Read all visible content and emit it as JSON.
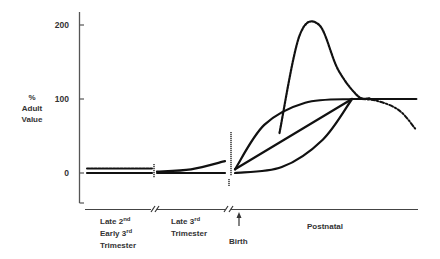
{
  "chart_data": {
    "type": "line",
    "title": "",
    "ylabel": [
      "%",
      "Adult",
      "Value"
    ],
    "xlabel": "",
    "ylim": [
      -40,
      220
    ],
    "yticks": [
      0,
      100,
      200
    ],
    "ytick_labels": [
      "0",
      "100",
      "200"
    ],
    "grid": false,
    "periods": [
      {
        "name": "late-2nd-early-3rd",
        "label_lines": [
          [
            "Late 2",
            "nd"
          ],
          [
            "Early 3",
            "rd"
          ],
          [
            "Trimester",
            ""
          ]
        ]
      },
      {
        "name": "late-3rd",
        "label_lines": [
          [
            "Late 3",
            "rd"
          ],
          [
            "Trimester",
            ""
          ]
        ]
      },
      {
        "name": "birth",
        "label_lines": [
          [
            "Birth",
            ""
          ]
        ],
        "marker": "up-arrow"
      },
      {
        "name": "postnatal",
        "label_lines": [
          [
            "Postnatal",
            ""
          ]
        ]
      }
    ],
    "axis_breaks": [
      "between-period-1-and-2",
      "between-period-2-and-postnatal"
    ],
    "series": [
      {
        "name": "prenatal-dashed",
        "style": "dashed",
        "period": "late-2nd-early-3rd",
        "points": [
          [
            0,
            6
          ],
          [
            1,
            6
          ]
        ]
      },
      {
        "name": "prenatal-solid-1",
        "style": "solid",
        "period": "late-2nd-early-3rd",
        "points": [
          [
            0,
            0
          ],
          [
            1,
            0
          ]
        ]
      },
      {
        "name": "late3rd-rising",
        "style": "solid",
        "period": "late-3rd",
        "points": [
          [
            0,
            2
          ],
          [
            0.5,
            5
          ],
          [
            1,
            16
          ]
        ]
      },
      {
        "name": "late3rd-flat",
        "style": "solid",
        "period": "late-3rd",
        "points": [
          [
            0,
            0
          ],
          [
            1,
            0
          ]
        ]
      },
      {
        "name": "postnatal-fast",
        "style": "solid",
        "period": "postnatal",
        "points": [
          [
            0,
            5
          ],
          [
            0.25,
            65
          ],
          [
            0.6,
            95
          ],
          [
            1,
            100
          ]
        ]
      },
      {
        "name": "postnatal-linear",
        "style": "solid",
        "period": "postnatal",
        "points": [
          [
            0,
            5
          ],
          [
            1,
            100
          ]
        ]
      },
      {
        "name": "postnatal-slow",
        "style": "solid",
        "period": "postnatal",
        "points": [
          [
            0,
            0
          ],
          [
            0.4,
            8
          ],
          [
            0.75,
            45
          ],
          [
            1,
            100
          ]
        ]
      },
      {
        "name": "postnatal-plateau",
        "style": "solid",
        "period": "postnatal",
        "points": [
          [
            1,
            100
          ],
          [
            1.55,
            100
          ]
        ]
      },
      {
        "name": "postnatal-overshoot",
        "style": "dotted",
        "period": "postnatal",
        "points": [
          [
            0.38,
            54
          ],
          [
            0.55,
            185
          ],
          [
            0.72,
            200
          ],
          [
            0.88,
            140
          ],
          [
            1.05,
            104
          ],
          [
            1.15,
            101
          ]
        ]
      },
      {
        "name": "postnatal-decline",
        "style": "dash-dot",
        "period": "postnatal",
        "points": [
          [
            1,
            100
          ],
          [
            1.2,
            98
          ],
          [
            1.4,
            85
          ],
          [
            1.54,
            60
          ]
        ]
      }
    ]
  }
}
